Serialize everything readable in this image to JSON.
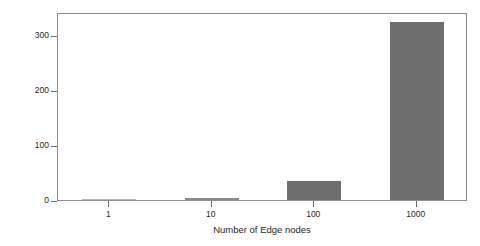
{
  "chart_data": {
    "type": "bar",
    "title": "",
    "xlabel": "Number of Edge nodes",
    "ylabel": "Expected deployment time (mins.)",
    "categories": [
      "1",
      "10",
      "100",
      "1000"
    ],
    "values": [
      0.4,
      3.2,
      34,
      324
    ],
    "series": [
      {
        "name": "Expected deployment time",
        "values": [
          0.4,
          3.2,
          34,
          324
        ]
      }
    ],
    "ylim": [
      0,
      342
    ],
    "yticks": [
      0,
      100,
      200,
      300
    ],
    "ytick_labels": [
      "0",
      "100",
      "200",
      "300"
    ],
    "xtick_labels": [
      "1",
      "10",
      "100",
      "1000"
    ],
    "grid": false,
    "legend": false,
    "bar_color": "#6e6e6e",
    "frame_color": "#8f8f8f",
    "background": "#ffffff"
  },
  "axes": {
    "y_title": "Expected deployment time (mins.)",
    "x_title": "Number of Edge nodes"
  }
}
